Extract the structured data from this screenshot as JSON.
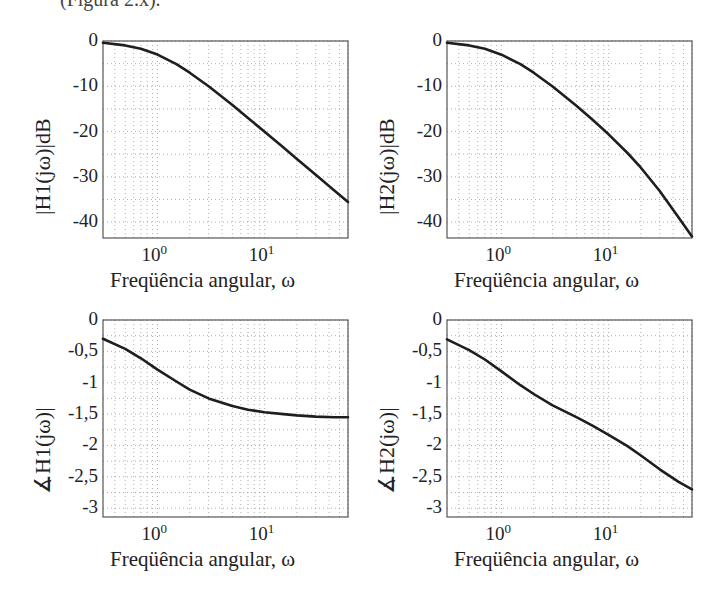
{
  "header": {
    "cropped_text": "(Figura 2.x)."
  },
  "chart_data": [
    {
      "id": "mag-h1",
      "type": "line",
      "title": "",
      "xlabel": "Freqüência angular, ω",
      "ylabel": "|H1(jω)|dB",
      "xscale": "log",
      "xlim": [
        0.31,
        60
      ],
      "ylim": [
        -43.5,
        0
      ],
      "yticks": [
        0,
        -10,
        -20,
        -30,
        -40
      ],
      "ytick_labels": [
        "0",
        "-10",
        "-20",
        "-30",
        "-40"
      ],
      "xticks": [
        1,
        10
      ],
      "xtick_labels": [
        "10^0",
        "10^1"
      ],
      "grid": true,
      "x": [
        0.31,
        0.5,
        0.7,
        1,
        1.5,
        2,
        3,
        5,
        7,
        10,
        15,
        20,
        30,
        45,
        60
      ],
      "values": [
        -0.4,
        -0.97,
        -1.73,
        -3.01,
        -5.12,
        -6.99,
        -10.0,
        -14.15,
        -17.0,
        -20.04,
        -23.54,
        -26.03,
        -29.55,
        -33.07,
        -35.56
      ]
    },
    {
      "id": "mag-h2",
      "type": "line",
      "title": "",
      "xlabel": "Freqüência angular, ω",
      "ylabel": "|H2(jω)|dB",
      "xscale": "log",
      "xlim": [
        0.31,
        60
      ],
      "ylim": [
        -43.5,
        0
      ],
      "yticks": [
        0,
        -10,
        -20,
        -30,
        -40
      ],
      "ytick_labels": [
        "0",
        "-10",
        "-20",
        "-30",
        "-40"
      ],
      "xticks": [
        1,
        10
      ],
      "xtick_labels": [
        "10^0",
        "10^1"
      ],
      "grid": true,
      "x": [
        0.31,
        0.5,
        0.7,
        1,
        1.5,
        2,
        3,
        5,
        7,
        10,
        15,
        20,
        30,
        45,
        60
      ],
      "values": [
        -0.4,
        -0.97,
        -1.73,
        -3.02,
        -5.13,
        -7.01,
        -10.05,
        -14.3,
        -17.28,
        -20.6,
        -24.72,
        -27.97,
        -33.12,
        -38.97,
        -43.17
      ]
    },
    {
      "id": "phase-h1",
      "type": "line",
      "title": "",
      "xlabel": "Freqüência angular, ω",
      "ylabel": "∡H1(jω)|",
      "xscale": "log",
      "xlim": [
        0.31,
        60
      ],
      "ylim": [
        -3.14,
        0
      ],
      "yticks": [
        0,
        -0.5,
        -1,
        -1.5,
        -2,
        -2.5,
        -3
      ],
      "ytick_labels": [
        "0",
        "-0,5",
        "-1",
        "-1,5",
        "-2",
        "-2,5",
        "-3"
      ],
      "xticks": [
        1,
        10
      ],
      "xtick_labels": [
        "10^0",
        "10^1"
      ],
      "grid": true,
      "x": [
        0.31,
        0.5,
        0.7,
        1,
        1.5,
        2,
        3,
        5,
        7,
        10,
        15,
        20,
        30,
        45,
        60
      ],
      "values": [
        -0.3,
        -0.46,
        -0.61,
        -0.79,
        -0.98,
        -1.11,
        -1.25,
        -1.37,
        -1.43,
        -1.47,
        -1.5,
        -1.52,
        -1.54,
        -1.55,
        -1.55
      ]
    },
    {
      "id": "phase-h2",
      "type": "line",
      "title": "",
      "xlabel": "Freqüência angular, ω",
      "ylabel": "∡H2(jω)|",
      "xscale": "log",
      "xlim": [
        0.31,
        60
      ],
      "ylim": [
        -3.14,
        0
      ],
      "yticks": [
        0,
        -0.5,
        -1,
        -1.5,
        -2,
        -2.5,
        -3
      ],
      "ytick_labels": [
        "0",
        "-0,5",
        "-1",
        "-1,5",
        "-2",
        "-2,5",
        "-3"
      ],
      "xticks": [
        1,
        10
      ],
      "xtick_labels": [
        "10^0",
        "10^1"
      ],
      "grid": true,
      "x": [
        0.31,
        0.5,
        0.7,
        1,
        1.5,
        2,
        3,
        5,
        7,
        10,
        15,
        20,
        30,
        45,
        60
      ],
      "values": [
        -0.31,
        -0.48,
        -0.63,
        -0.82,
        -1.04,
        -1.18,
        -1.36,
        -1.55,
        -1.68,
        -1.83,
        -2.01,
        -2.16,
        -2.38,
        -2.58,
        -2.7
      ]
    }
  ],
  "style": {
    "line_color": "#1e1e1e",
    "axis_color": "#555555",
    "grid_color": "#9a9a9a",
    "text_color": "#222222"
  }
}
